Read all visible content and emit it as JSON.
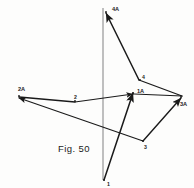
{
  "figure": {
    "caption": "Fig. 50",
    "caption_pos": {
      "x": 58,
      "y": 143
    },
    "background_color": "#fdfdfc",
    "stroke_color": "#1a1a1a",
    "axis_color": "#8c8c8c"
  },
  "chart_data": {
    "type": "diagram",
    "title": "Fig. 50",
    "subtitle": "",
    "xlabel": "",
    "ylabel": "",
    "grid": false,
    "legend": null,
    "axis_ranges": {
      "x": [
        0,
        194
      ],
      "y": [
        0,
        188
      ]
    },
    "reference_axis": {
      "name": "vertical-axis",
      "x1": 103,
      "y1": 8,
      "x2": 103,
      "y2": 180,
      "color": "#8c8c8c",
      "width": 1.1
    },
    "points": [
      {
        "id": "p1",
        "label": "1",
        "x": 104,
        "y": 180,
        "label_dx": 3,
        "label_dy": 5,
        "size": "sm"
      },
      {
        "id": "p2",
        "label": "2",
        "x": 75,
        "y": 101,
        "label_dx": -1,
        "label_dy": -3,
        "size": "sm"
      },
      {
        "id": "p3",
        "label": "3",
        "x": 143,
        "y": 141,
        "label_dx": 1,
        "label_dy": 7,
        "size": "sm"
      },
      {
        "id": "p4",
        "label": "4",
        "x": 140,
        "y": 80,
        "label_dx": 2,
        "label_dy": -2,
        "size": "sm"
      },
      {
        "id": "p1a",
        "label": "1A",
        "x": 133,
        "y": 93,
        "label_dx": 4,
        "label_dy": -1,
        "size": "md"
      },
      {
        "id": "p2a",
        "label": "2A",
        "x": 19,
        "y": 96,
        "label_dx": -1,
        "label_dy": -6,
        "size": "md"
      },
      {
        "id": "p3a",
        "label": "3A",
        "x": 181,
        "y": 97,
        "label_dx": -1,
        "label_dy": 8,
        "size": "md"
      },
      {
        "id": "p4a",
        "label": "4A",
        "x": 106,
        "y": 12,
        "label_dx": 6,
        "label_dy": -2,
        "size": "md"
      }
    ],
    "vectors": [
      {
        "id": "v-1-to-1a",
        "name": "vector-1-to-1A",
        "from": "p1",
        "to": "p1a",
        "x1": 104,
        "y1": 180,
        "x2": 133,
        "y2": 93,
        "arrow": true,
        "width": 1.5
      },
      {
        "id": "v-2a-to-2",
        "name": "vector-2A-to-2",
        "from": "p2a",
        "to": "p2",
        "x1": 19,
        "y1": 97,
        "x2": 75,
        "y2": 102,
        "arrow": false,
        "width": 1.3
      },
      {
        "id": "v-2-to-1a",
        "name": "vector-2-to-1A",
        "from": "p2",
        "to": "p1a",
        "x1": 75,
        "y1": 102,
        "x2": 133,
        "y2": 94,
        "arrow": true,
        "width": 1.1
      },
      {
        "id": "v-3-to-2a",
        "name": "vector-3-to-2A",
        "from": "p3",
        "to": "p2a",
        "x1": 143,
        "y1": 141,
        "x2": 19,
        "y2": 98,
        "arrow": true,
        "width": 1.1
      },
      {
        "id": "v-3-to-3a",
        "name": "vector-3-to-3A",
        "from": "p3",
        "to": "p3a",
        "x1": 143,
        "y1": 141,
        "x2": 181,
        "y2": 98,
        "arrow": true,
        "width": 1.4
      },
      {
        "id": "v-3a-to-4",
        "name": "vector-3A-to-4",
        "from": "p3a",
        "to": "p4",
        "x1": 182,
        "y1": 96,
        "x2": 139,
        "y2": 80,
        "arrow": false,
        "width": 1.3
      },
      {
        "id": "v-4-to-4a",
        "name": "vector-4-to-4A",
        "from": "p4",
        "to": "p4a",
        "x1": 139,
        "y1": 80,
        "x2": 106,
        "y2": 13,
        "arrow": true,
        "width": 1.5
      },
      {
        "id": "v-1a-to-3a",
        "name": "vector-1A-to-3A",
        "from": "p1a",
        "to": "p3a",
        "x1": 134,
        "y1": 94,
        "x2": 182,
        "y2": 96,
        "arrow": false,
        "width": 1.2
      }
    ],
    "labels": [
      "1",
      "2",
      "3",
      "4",
      "1A",
      "2A",
      "3A",
      "4A"
    ],
    "annotations": [
      "Fig. 50"
    ]
  }
}
